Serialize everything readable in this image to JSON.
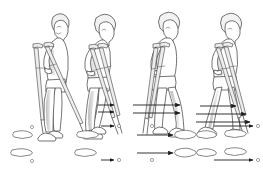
{
  "illustration": {
    "title": "Three-point crutch gait sequence",
    "type": "line-art medical illustration",
    "background_color": "#ffffff",
    "ink_color": "#3a3a3a",
    "shade_color": "#cfcfcf",
    "arrow_color": "#1d1d1d",
    "panel_count": 4
  },
  "panels": [
    {
      "index": 1,
      "name": "stance-start",
      "caption": "",
      "figure": {
        "name": "person-with-crutches",
        "pose": "standing upright, both crutches planted beside feet",
        "facing": "right",
        "crutch_count": 2
      },
      "motion_arrows": [],
      "floor_diagram": {
        "name": "footprint-pattern-1",
        "footprints": [
          {
            "label": "",
            "side": "far-foot",
            "x": 22,
            "y": 134
          },
          {
            "label": "",
            "side": "near-foot",
            "x": 22,
            "y": 152
          }
        ],
        "crutch_tips": [
          {
            "label": "",
            "x": 32,
            "y": 128
          },
          {
            "label": "",
            "x": 32,
            "y": 160
          }
        ],
        "arrows": []
      }
    },
    {
      "index": 2,
      "name": "crutches-advance",
      "caption": "",
      "figure": {
        "name": "person-with-crutches",
        "pose": "leaning forward, crutches swung ahead of body",
        "facing": "right",
        "crutch_count": 2
      },
      "motion_arrows": [
        {
          "name": "crutch-advance-arrow-upper",
          "x1": 98,
          "y1": 105,
          "x2": 116,
          "y2": 105
        },
        {
          "name": "crutch-advance-arrow-lower",
          "x1": 98,
          "y1": 112,
          "x2": 116,
          "y2": 112
        }
      ],
      "floor_diagram": {
        "name": "footprint-pattern-2",
        "footprints": [
          {
            "label": "",
            "side": "far-foot",
            "x": 86,
            "y": 134
          },
          {
            "label": "",
            "side": "near-foot",
            "x": 86,
            "y": 152
          }
        ],
        "crutch_tips": [
          {
            "label": "",
            "x": 118,
            "y": 126
          },
          {
            "label": "",
            "x": 118,
            "y": 160
          }
        ],
        "arrows": [
          {
            "name": "crutch-tip-arrow-upper",
            "x1": 100,
            "y1": 126,
            "x2": 114,
            "y2": 126
          },
          {
            "name": "crutch-tip-arrow-lower",
            "x1": 100,
            "y1": 160,
            "x2": 114,
            "y2": 160
          }
        ]
      }
    },
    {
      "index": 3,
      "name": "body-swings-through",
      "caption": "",
      "figure": {
        "name": "person-with-crutches",
        "pose": "weight on crutches, body swinging forward between them",
        "facing": "right",
        "crutch_count": 2
      },
      "motion_arrows": [
        {
          "name": "body-advance-arrow-upper",
          "x1": 134,
          "y1": 105,
          "x2": 182,
          "y2": 105
        },
        {
          "name": "body-advance-arrow-lower",
          "x1": 134,
          "y1": 113,
          "x2": 182,
          "y2": 113
        }
      ],
      "floor_diagram": {
        "name": "footprint-pattern-3",
        "footprints": [
          {
            "label": "",
            "side": "far-foot",
            "x": 182,
            "y": 134
          },
          {
            "label": "",
            "side": "near-foot",
            "x": 182,
            "y": 152
          }
        ],
        "crutch_tips": [
          {
            "label": "",
            "x": 152,
            "y": 126
          },
          {
            "label": "",
            "x": 152,
            "y": 160
          }
        ],
        "arrows": [
          {
            "name": "foot-advance-arrow-upper",
            "x1": 138,
            "y1": 135,
            "x2": 176,
            "y2": 135
          },
          {
            "name": "foot-advance-arrow-lower",
            "x1": 138,
            "y1": 153,
            "x2": 176,
            "y2": 153
          }
        ]
      }
    },
    {
      "index": 4,
      "name": "step-completed",
      "caption": "",
      "figure": {
        "name": "person-with-crutches",
        "pose": "foot landed ahead, crutches trailing behind ready to advance",
        "facing": "right",
        "crutch_count": 2
      },
      "motion_arrows": [
        {
          "name": "next-step-arrow-upper",
          "x1": 200,
          "y1": 106,
          "x2": 238,
          "y2": 106
        },
        {
          "name": "next-step-arrow-middle",
          "x1": 196,
          "y1": 114,
          "x2": 248,
          "y2": 114
        },
        {
          "name": "next-step-arrow-lower",
          "x1": 196,
          "y1": 122,
          "x2": 252,
          "y2": 122
        }
      ],
      "floor_diagram": {
        "name": "footprint-pattern-4",
        "footprints": [
          {
            "label": "",
            "side": "far-foot-rear",
            "x": 205,
            "y": 134
          },
          {
            "label": "",
            "side": "far-foot-front",
            "x": 234,
            "y": 134
          },
          {
            "label": "",
            "side": "near-foot-rear",
            "x": 205,
            "y": 152
          },
          {
            "label": "",
            "side": "near-foot-front",
            "x": 234,
            "y": 152
          }
        ],
        "crutch_tips": [
          {
            "label": "",
            "x": 258,
            "y": 126
          },
          {
            "label": "",
            "x": 258,
            "y": 160
          }
        ],
        "arrows": [
          {
            "name": "crutch-tip-arrow-upper",
            "x1": 214,
            "y1": 126,
            "x2": 254,
            "y2": 126
          },
          {
            "name": "crutch-tip-arrow-lower",
            "x1": 214,
            "y1": 160,
            "x2": 254,
            "y2": 160
          }
        ]
      }
    }
  ],
  "legend": {
    "footprint_symbol": "outlined shoe sole",
    "crutch_tip_symbol": "small circle",
    "arrow_symbol": "direction of travel"
  }
}
